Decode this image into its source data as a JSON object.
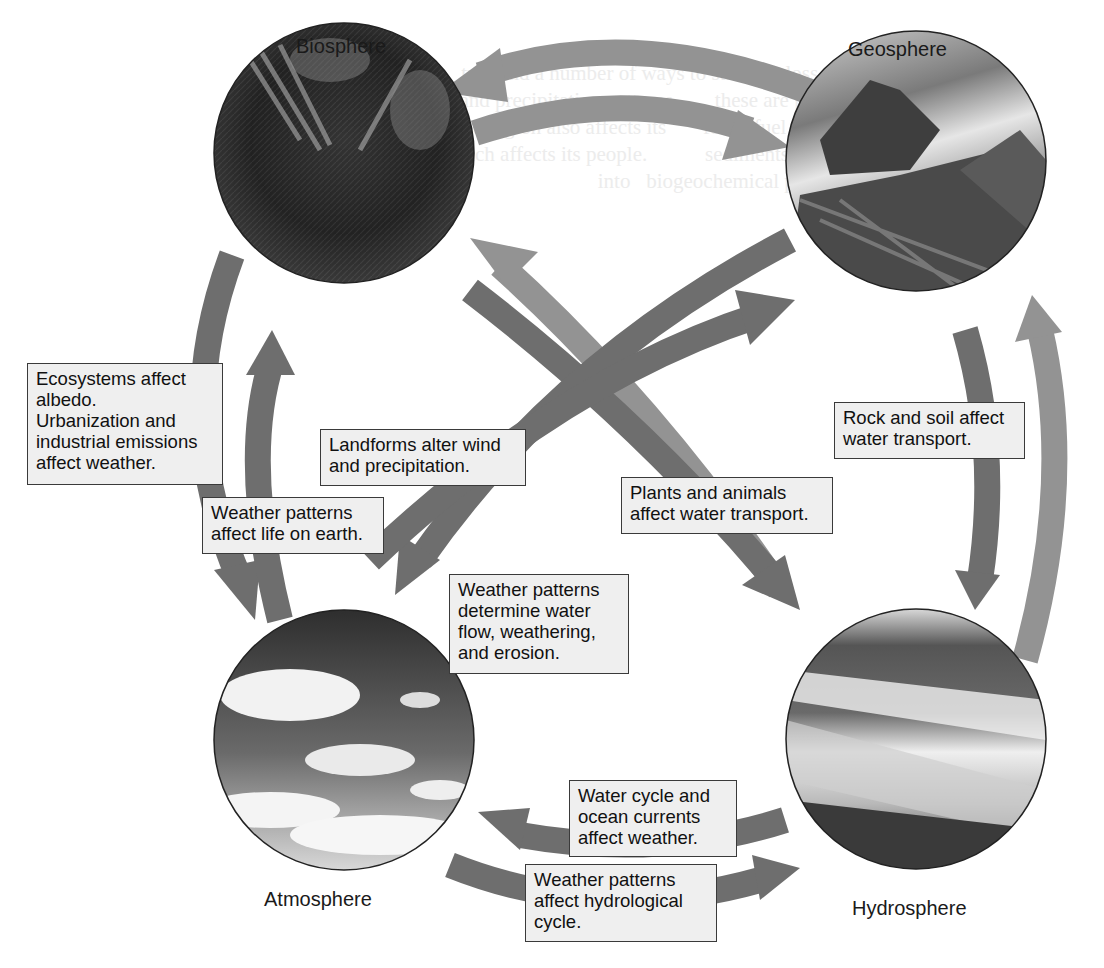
{
  "colors": {
    "arrow_dark": "#6e6e6e",
    "arrow_light": "#939393",
    "callout_bg": "#efefef",
    "callout_border": "#3a3a3a"
  },
  "spheres": {
    "biosphere": {
      "label": "Biosphere",
      "image": "rainforest-photo"
    },
    "geosphere": {
      "label": "Geosphere",
      "image": "mountain-glacier-photo"
    },
    "atmosphere": {
      "label": "Atmosphere",
      "image": "cloudy-sky-photo"
    },
    "hydrosphere": {
      "label": "Hydrosphere",
      "image": "ocean-shoreline-photo"
    }
  },
  "callouts": {
    "ecosystems": "Ecosystems affect\nalbedo.\nUrbanization and\nindustrial emissions\naffect weather.",
    "weather_life": "Weather patterns\naffect life on earth.",
    "landforms": "Landforms alter wind\nand precipitation.",
    "plants_animals": "Plants and animals\naffect water transport.",
    "rock_soil": "Rock and soil affect\nwater transport.",
    "weather_erosion": "Weather patterns\ndetermine water\nflow, weathering,\nand erosion.",
    "water_cycle": "Water cycle and\nocean currents\naffect weather.",
    "weather_hydro": "Weather patterns\naffect hydrological\ncycle."
  }
}
